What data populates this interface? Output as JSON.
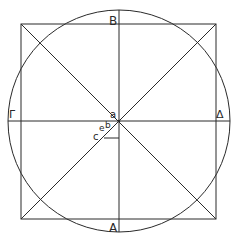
{
  "diagram": {
    "type": "geometric-construction",
    "colors": {
      "stroke": "#2a2a2a",
      "background": "#ffffff"
    },
    "labels": {
      "top": "B",
      "bottom": "A",
      "left": "Γ",
      "right": "Δ",
      "center": "a",
      "b": "b",
      "e": "e",
      "c": "c"
    }
  }
}
